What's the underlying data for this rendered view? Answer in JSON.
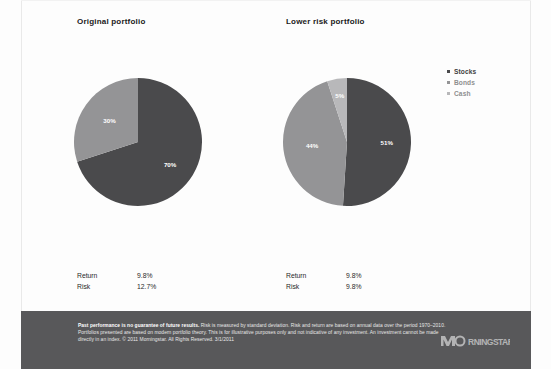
{
  "charts": [
    {
      "title": "Original portfolio",
      "stats": [
        {
          "label": "Return",
          "value": "9.8%"
        },
        {
          "label": "Risk",
          "value": "12.7%"
        }
      ]
    },
    {
      "title": "Lower risk portfolio",
      "stats": [
        {
          "label": "Return",
          "value": "9.8%"
        },
        {
          "label": "Risk",
          "value": "9.8%"
        }
      ]
    }
  ],
  "legend": {
    "items": [
      {
        "label": "Stocks",
        "color": "#4a4a4c"
      },
      {
        "label": "Bonds",
        "color": "#949496"
      },
      {
        "label": "Cash",
        "color": "#b8b8ba"
      }
    ]
  },
  "footer": {
    "lead": "Past performance is no guarantee of future results.",
    "body": " Risk is measured by standard deviation. Risk and return are based on annual data over the period 1970–2010. Portfolios presented are based on modern portfolio theory. This is for illustrative purposes only and not indicative of any investment. An investment cannot be made directly in an index. © 2011 Morningstar. All Rights Reserved. 3/1/2011",
    "logo": "morningstar-logo"
  },
  "chart_data": [
    {
      "type": "pie",
      "title": "Original portfolio",
      "labels": [
        "Stocks",
        "Bonds",
        "Cash"
      ],
      "values": [
        70,
        30,
        0
      ],
      "data_labels": [
        "70%",
        "30%",
        ""
      ],
      "colors": [
        "#4a4a4c",
        "#949496",
        "#b8b8ba"
      ],
      "start_angle": 0,
      "direction": "clockwise",
      "legend_position": "right",
      "annotations": [
        "Return 9.8%",
        "Risk 12.7%"
      ]
    },
    {
      "type": "pie",
      "title": "Lower risk portfolio",
      "labels": [
        "Stocks",
        "Bonds",
        "Cash"
      ],
      "values": [
        51,
        44,
        5
      ],
      "data_labels": [
        "51%",
        "44%",
        "5%"
      ],
      "colors": [
        "#4a4a4c",
        "#949496",
        "#b8b8ba"
      ],
      "start_angle": 0,
      "direction": "clockwise",
      "legend_position": "right",
      "annotations": [
        "Return 9.8%",
        "Risk 9.8%"
      ]
    }
  ]
}
